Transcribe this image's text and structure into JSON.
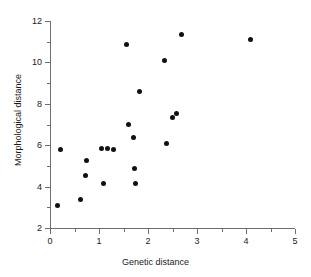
{
  "chart_data": {
    "type": "scatter",
    "title": "",
    "xlabel": "Genetic distance",
    "ylabel": "Morphological distance",
    "xlim": [
      0,
      5
    ],
    "ylim": [
      2,
      12
    ],
    "xticks": [
      0,
      1,
      2,
      3,
      4,
      5
    ],
    "xtick_labels": [
      "0",
      "1",
      "2",
      "3",
      "4",
      "5"
    ],
    "xminor_ticks": [
      0.5,
      1.5,
      2.5,
      3.5,
      4.5
    ],
    "yticks": [
      2,
      4,
      6,
      8,
      10,
      12
    ],
    "ytick_labels": [
      "2",
      "4",
      "6",
      "8",
      "10",
      "12"
    ],
    "yminor_ticks": [
      3,
      5,
      7,
      9,
      11
    ],
    "grid": false,
    "legend": null,
    "marker": "filled-circle",
    "marker_color": "#111111",
    "axis_color": "#6e6e6e",
    "background": "#ffffff",
    "n_points": 20,
    "points": [
      {
        "x": 0.15,
        "y": 3.07
      },
      {
        "x": 0.22,
        "y": 5.78
      },
      {
        "x": 0.62,
        "y": 3.38
      },
      {
        "x": 0.73,
        "y": 4.56
      },
      {
        "x": 0.75,
        "y": 5.28
      },
      {
        "x": 1.05,
        "y": 5.85
      },
      {
        "x": 1.1,
        "y": 4.17
      },
      {
        "x": 1.17,
        "y": 5.85
      },
      {
        "x": 1.3,
        "y": 5.79
      },
      {
        "x": 1.57,
        "y": 10.87
      },
      {
        "x": 1.6,
        "y": 7.0
      },
      {
        "x": 1.7,
        "y": 6.38
      },
      {
        "x": 1.72,
        "y": 4.88
      },
      {
        "x": 1.75,
        "y": 4.13
      },
      {
        "x": 1.82,
        "y": 8.6
      },
      {
        "x": 2.33,
        "y": 10.1
      },
      {
        "x": 2.37,
        "y": 6.07
      },
      {
        "x": 2.5,
        "y": 7.35
      },
      {
        "x": 2.58,
        "y": 7.53
      },
      {
        "x": 2.68,
        "y": 11.37
      },
      {
        "x": 4.1,
        "y": 11.1
      }
    ]
  },
  "axes": {
    "x_title": "Genetic distance",
    "y_title": "Morphological distance"
  }
}
